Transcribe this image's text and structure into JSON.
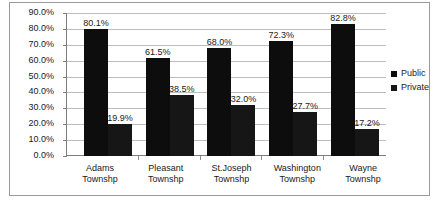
{
  "chart_data": {
    "type": "bar",
    "title": "",
    "xlabel": "",
    "ylabel": "",
    "ylim": [
      0,
      90
    ],
    "grid": true,
    "legend_position": "right",
    "categories": [
      "Adams Townshp",
      "Pleasant Townshp",
      "St.Joseph Townshp",
      "Washington Townshp",
      "Wayne Townshp"
    ],
    "category_lines": [
      [
        "Adams",
        "Townshp"
      ],
      [
        "Pleasant",
        "Townshp"
      ],
      [
        "St.Joseph",
        "Townshp"
      ],
      [
        "Washington",
        "Townshp"
      ],
      [
        "Wayne",
        "Townshp"
      ]
    ],
    "series": [
      {
        "name": "Public",
        "color": "#0d0d0d",
        "values": [
          80.1,
          61.5,
          68.0,
          72.3,
          82.8
        ],
        "labels": [
          "80.1%",
          "61.5%",
          "68.0%",
          "72.3%",
          "82.8%"
        ]
      },
      {
        "name": "Private",
        "color": "#161616",
        "values": [
          19.9,
          38.5,
          32.0,
          27.7,
          17.2
        ],
        "labels": [
          "19.9%",
          "38.5%",
          "32.0%",
          "27.7%",
          "17.2%"
        ]
      }
    ],
    "yticks": [
      0,
      10,
      20,
      30,
      40,
      50,
      60,
      70,
      80,
      90
    ],
    "ytick_labels": [
      "0.0%",
      "10.0%",
      "20.0%",
      "30.0%",
      "40.0%",
      "50.0%",
      "60.0%",
      "70.0%",
      "80.0%",
      "90.0%"
    ]
  },
  "legend": {
    "items": [
      {
        "label": "Public",
        "color": "#0d0d0d"
      },
      {
        "label": "Private",
        "color": "#161616"
      }
    ]
  }
}
